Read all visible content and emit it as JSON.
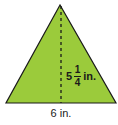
{
  "figure": {
    "shape": "isosceles triangle",
    "fill_color": "#9bcb3b",
    "stroke_color": "#1a1a1a",
    "height_label": {
      "whole": "5",
      "numerator": "1",
      "denominator": "4",
      "unit": "in."
    },
    "base_label": "6 in."
  }
}
